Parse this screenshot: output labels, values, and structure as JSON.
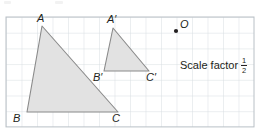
{
  "canvas": {
    "width": 261,
    "height": 130,
    "background": "#ffffff"
  },
  "grid": {
    "x0": 6,
    "y0": 17,
    "cols": 16,
    "rows": 7,
    "cell_w": 15.5,
    "cell_h": 15.7,
    "line_color": "#d5dbe0",
    "border_color": "#b9c0c6"
  },
  "style": {
    "shape_fill": "#e2e2e2",
    "shape_stroke": "#8a8a8a",
    "shape_stroke_width": 1.1,
    "point_color": "#231f20",
    "text_color": "#231f20"
  },
  "shapes": [
    {
      "name": "triangle-abc",
      "label": "ABC",
      "points": "42,26 118,112 27,112",
      "vertices": [
        {
          "id": "A",
          "label": "A",
          "x": 42,
          "y": 26
        },
        {
          "id": "B",
          "label": "B",
          "x": 27,
          "y": 112
        },
        {
          "id": "C",
          "label": "C",
          "x": 118,
          "y": 112
        }
      ]
    },
    {
      "name": "triangle-a-prime-b-prime-c-prime",
      "label": "A'B'C'",
      "points": "113,28 149,71 104,71",
      "vertices": [
        {
          "id": "A'",
          "label": "A′",
          "x": 113,
          "y": 28
        },
        {
          "id": "B'",
          "label": "B′",
          "x": 104,
          "y": 71
        },
        {
          "id": "C'",
          "label": "C′",
          "x": 149,
          "y": 71
        }
      ]
    }
  ],
  "center_of_enlargement": {
    "label": "O",
    "x": 176,
    "y": 31,
    "radius": 2.1
  },
  "annotation": {
    "scale_factor_text": "Scale factor",
    "fraction_numerator": "1",
    "fraction_denominator": "2",
    "x": 180,
    "y": 57
  },
  "vertex_labels": [
    {
      "text": "A",
      "left": 37,
      "top": 13,
      "name": "vertex-label-a"
    },
    {
      "text": "B",
      "left": 13,
      "top": 113,
      "name": "vertex-label-b"
    },
    {
      "text": "C",
      "left": 112,
      "top": 113,
      "name": "vertex-label-c"
    },
    {
      "text": "A′",
      "left": 107,
      "top": 14,
      "name": "vertex-label-a-prime"
    },
    {
      "text": "B′",
      "left": 93,
      "top": 72,
      "name": "vertex-label-b-prime"
    },
    {
      "text": "C′",
      "left": 146,
      "top": 72,
      "name": "vertex-label-c-prime"
    }
  ]
}
